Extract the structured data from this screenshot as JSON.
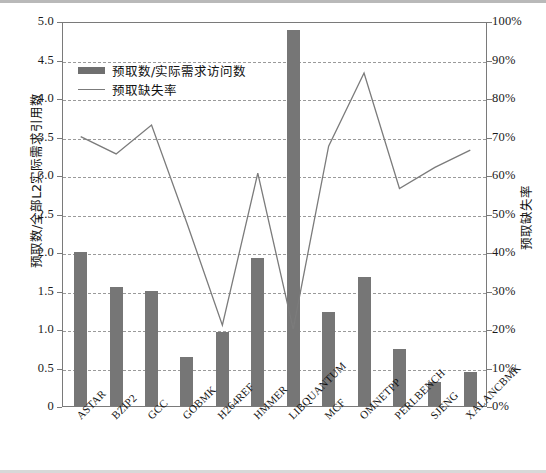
{
  "chart_data": {
    "type": "bar",
    "title": "",
    "categories": [
      "ASTAR",
      "BZIP2",
      "GCC",
      "GOBMK",
      "H264REF",
      "HMMER",
      "LIBQUANTUM",
      "MCF",
      "OMNETPP",
      "PERLBENCH",
      "SJENG",
      "XALANCBMK"
    ],
    "series": [
      {
        "name": "预取数/实际需求访问数",
        "kind": "bar",
        "axis": "left",
        "color": "#767676",
        "values": [
          2.0,
          1.55,
          1.49,
          0.64,
          0.96,
          1.92,
          4.88,
          1.22,
          1.68,
          0.74,
          0.31,
          0.44
        ]
      },
      {
        "name": "预取缺失率",
        "kind": "line",
        "axis": "right",
        "color": "#7b7b7b",
        "values": [
          70.5,
          66.0,
          73.5,
          48.0,
          21.5,
          61.0,
          20.5,
          68.0,
          87.0,
          57.0,
          62.5,
          67.0
        ]
      }
    ],
    "xlabel": "",
    "ylabel": "预取数/全部L2实际需求引用数",
    "ylabel_right": "预取缺失率",
    "ylim": [
      0,
      5.0
    ],
    "ylim_right": [
      0,
      100
    ],
    "ytick_labels_left": [
      "5.0",
      "4.5",
      "4.0",
      "3.5",
      "3.0",
      "2.5",
      "2.0",
      "1.5",
      "1.0",
      "0.5",
      "0"
    ],
    "ytick_values_left": [
      5.0,
      4.5,
      4.0,
      3.5,
      3.0,
      2.5,
      2.0,
      1.5,
      1.0,
      0.5,
      0
    ],
    "ytick_labels_right": [
      "100%",
      "90%",
      "80%",
      "70%",
      "60%",
      "50%",
      "40%",
      "30%",
      "20%",
      "10%",
      "0%"
    ],
    "ytick_values_right": [
      100,
      90,
      80,
      70,
      60,
      50,
      40,
      30,
      20,
      10,
      0
    ],
    "grid": true,
    "grid_style": "dashed-horizontal",
    "legend_position": "upper-left-inside"
  },
  "legend": {
    "bar_label": "预取数/实际需求访问数",
    "line_label": "预取缺失率"
  }
}
